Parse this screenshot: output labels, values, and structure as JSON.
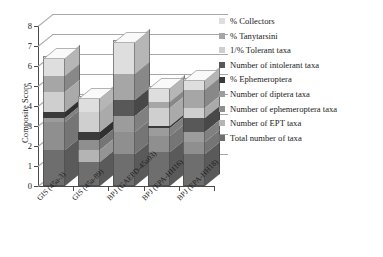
{
  "chart_data": {
    "type": "bar",
    "subtype": "stacked-bar-3d",
    "title": "",
    "xlabel": "",
    "ylabel": "Composite Score",
    "ylim": [
      0,
      8
    ],
    "yticks": [
      0,
      1,
      2,
      3,
      4,
      5,
      6,
      7,
      8
    ],
    "ytick_labels": [
      "0",
      "1",
      "2",
      "3",
      "4",
      "5",
      "6",
      "7",
      "8"
    ],
    "grid": true,
    "legend_position": "right",
    "categories": [
      "GIS (45a-3)",
      "GIS (45a-89)",
      "BPJ (GAEPD-45a03)",
      "BPJ (EPA-HH16)",
      "BPJ (EPA-HH18)"
    ],
    "series": [
      {
        "name": "Total number of taxa",
        "color": "#6e6e6e",
        "values": [
          1.8,
          1.2,
          1.6,
          1.7,
          1.6
        ]
      },
      {
        "name": "Number of EPT taxa",
        "color": "#b4b4b4",
        "values": [
          0.0,
          0.6,
          0.0,
          0.0,
          0.0
        ]
      },
      {
        "name": "Number of ephemeroptera taxa",
        "color": "#8f8f8f",
        "values": [
          1.4,
          0.5,
          1.1,
          0.8,
          0.6
        ]
      },
      {
        "name": "Number of diptera taxa",
        "color": "#9c9c9c",
        "values": [
          0.2,
          0.0,
          0.8,
          0.4,
          0.5
        ]
      },
      {
        "name": "% Ephemeroptera",
        "color": "#3a3a3a",
        "values": [
          0.3,
          0.4,
          0.0,
          0.1,
          0.0
        ]
      },
      {
        "name": "Number of intolerant taxa",
        "color": "#585858",
        "values": [
          0.0,
          0.0,
          0.8,
          0.0,
          0.7
        ]
      },
      {
        "name": "1/% Tolerant taxa",
        "color": "#cfcfcf",
        "values": [
          1.0,
          1.0,
          0.0,
          0.9,
          0.5
        ]
      },
      {
        "name": "% Tanytarsini",
        "color": "#a6a6a6",
        "values": [
          0.8,
          0.0,
          1.3,
          0.3,
          0.9
        ]
      },
      {
        "name": "% Collectors",
        "color": "#dedede",
        "values": [
          1.0,
          0.8,
          1.7,
          0.8,
          0.6
        ]
      }
    ],
    "totals": [
      6.5,
      4.5,
      7.3,
      5.0,
      5.4
    ]
  },
  "legend": {
    "items": [
      {
        "label": "% Collectors",
        "color": "#dedede"
      },
      {
        "label": "% Tanytarsini",
        "color": "#a6a6a6"
      },
      {
        "label": "1/% Tolerant taxa",
        "color": "#cfcfcf"
      },
      {
        "label": "Number of intolerant taxa",
        "color": "#585858"
      },
      {
        "label": "% Ephemeroptera",
        "color": "#3a3a3a"
      },
      {
        "label": "Number of diptera taxa",
        "color": "#9c9c9c"
      },
      {
        "label": "Number of ephemeroptera taxa",
        "color": "#8f8f8f"
      },
      {
        "label": "Number of EPT taxa",
        "color": "#b4b4b4"
      },
      {
        "label": "Total number of taxa",
        "color": "#6e6e6e"
      }
    ]
  }
}
